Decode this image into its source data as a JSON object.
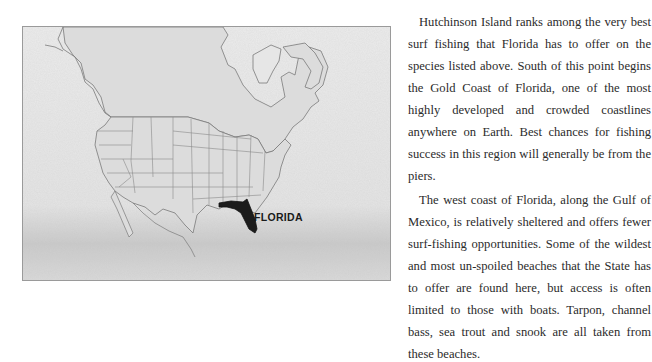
{
  "map": {
    "label": "FLORIDA",
    "description": "Map of North America with contiguous United States state borders; Florida highlighted in black",
    "colors": {
      "land": "#dcdcdc",
      "ocean_texture": "#e9e9e9",
      "borders": "#7a7a7a",
      "highlight": "#1c1c1c"
    }
  },
  "article": {
    "paragraphs": [
      "Hutchinson Island ranks among the very best surf fishing that Florida has to offer on the species listed above. South of this point begins the Gold Coast of Florida, one of the most highly developed and crowded coastlines anywhere on Earth. Best chances for fishing success in this region will generally be from the piers.",
      "The west coast of Florida, along the Gulf of Mexico, is relatively sheltered and offers fewer surf-fishing opportunities. Some of the wildest and most un-spoiled beaches that the State has to offer are found here, but access is often limited to those with boats. Tarpon, channel bass, sea trout and snook are all taken from these beaches."
    ]
  }
}
